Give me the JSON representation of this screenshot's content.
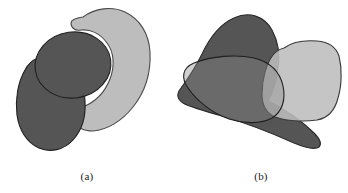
{
  "figure": {
    "background_color": "#ffffff",
    "width": 348,
    "height": 193,
    "panels": [
      {
        "id": "a",
        "caption": "(a)",
        "description": "Three opaque overlapping regions: a light gray crescent, a dark gray disk and a dark gray elongated blob",
        "shapes": [
          {
            "name": "light-crescent",
            "fill": "#bdbdbd",
            "stroke": "#4a4a4a",
            "opacity": 1,
            "kind": "crescent"
          },
          {
            "name": "dark-disk",
            "fill": "#555555",
            "stroke": "#1f1f1f",
            "opacity": 1,
            "kind": "ellipse"
          },
          {
            "name": "dark-blob",
            "fill": "#555555",
            "stroke": "#1f1f1f",
            "opacity": 1,
            "kind": "blob"
          }
        ]
      },
      {
        "id": "b",
        "caption": "(b)",
        "description": "Three semi-transparent overlapping rounded regions with visible outlines and darker intersection areas",
        "shapes": [
          {
            "name": "dark-blob",
            "fill": "#555555",
            "stroke": "#2a2a2a",
            "opacity": 1,
            "kind": "blob"
          },
          {
            "name": "light-rounded-square",
            "fill": "#bdbdbd",
            "stroke": "#3a3a3a",
            "opacity": 0.85,
            "kind": "rounded-quad"
          },
          {
            "name": "translucent-lens",
            "fill": "#8a8a8a",
            "stroke": "#1f1f1f",
            "opacity": 0.45,
            "kind": "lens"
          }
        ]
      }
    ],
    "colors": {
      "dark_gray": "#555555",
      "light_gray": "#bdbdbd",
      "outline_dark": "#1f1f1f",
      "outline_mid": "#3a3a3a",
      "overlap_dark": "#3f3f3f",
      "background": "#ffffff"
    }
  }
}
